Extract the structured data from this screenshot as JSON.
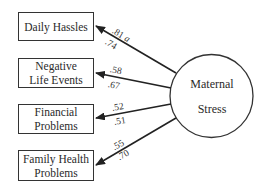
{
  "latent": {
    "label_line1": "Maternal",
    "label_line2": "Stress"
  },
  "indicators": [
    {
      "lines": [
        "Daily Hassles"
      ],
      "coef_top": ".81",
      "coef_bottom": ".74",
      "note": "a"
    },
    {
      "lines": [
        "Negative",
        "Life Events"
      ],
      "coef_top": ".58",
      "coef_bottom": ".67"
    },
    {
      "lines": [
        "Financial",
        "Problems"
      ],
      "coef_top": ".52",
      "coef_bottom": ".51"
    },
    {
      "lines": [
        "Family Health",
        "Problems"
      ],
      "coef_top": ".55",
      "coef_bottom": ".70"
    }
  ],
  "colors": {
    "stroke": "#333333",
    "background": "#ffffff"
  }
}
